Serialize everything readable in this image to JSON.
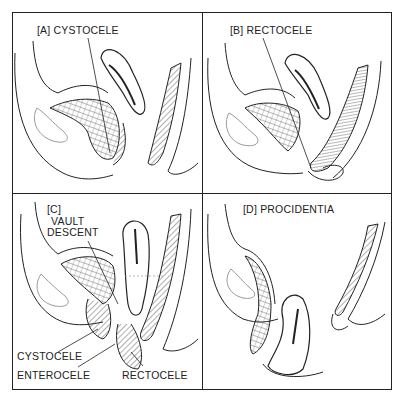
{
  "figure": {
    "panels": [
      {
        "id": "A",
        "title": "[A] CYSTOCELE"
      },
      {
        "id": "B",
        "title": "[B] RECTOCELE"
      },
      {
        "id": "C",
        "title": "[C]",
        "labels": [
          "VAULT",
          "DESCENT",
          "CYSTOCELE",
          "ENTEROCELE",
          "RECTOCELE"
        ]
      },
      {
        "id": "D",
        "title": "[D] PROCIDENTIA"
      }
    ]
  }
}
